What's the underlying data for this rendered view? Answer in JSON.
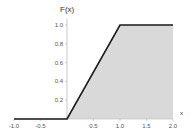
{
  "chart_data": {
    "type": "area",
    "title": "",
    "xlabel": "x",
    "ylabel": "F(x)",
    "xlim": [
      -1.0,
      2.0
    ],
    "ylim": [
      0,
      1.0
    ],
    "grid": false,
    "legend": null,
    "series": [
      {
        "name": "F(x)",
        "x": [
          -1.0,
          0.0,
          1.0,
          2.0
        ],
        "y": [
          0.0,
          0.0,
          1.0,
          1.0
        ],
        "shaded_region": {
          "x_from": 0.0,
          "x_to": 2.0
        }
      }
    ],
    "x_ticks": [
      "-1.0",
      "-0.5",
      "0.5",
      "1.0",
      "1.5",
      "2.0"
    ],
    "x_tick_values": [
      -1.0,
      -0.5,
      0.5,
      1.0,
      1.5,
      2.0
    ],
    "y_ticks": [
      "0.2",
      "0.4",
      "0.6",
      "0.8",
      "1.0"
    ],
    "y_tick_values": [
      0.2,
      0.4,
      0.6,
      0.8,
      1.0
    ]
  },
  "colors": {
    "line": "#1a1a1a",
    "fill": "#d9d9d9",
    "axis": "#bbbbbb"
  }
}
